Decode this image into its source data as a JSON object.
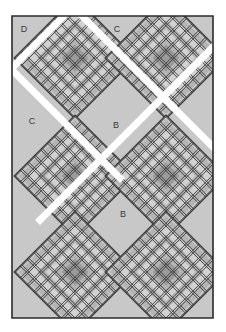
{
  "figure": {
    "kind": "quilt-block-layout-diagram",
    "width": 226,
    "height": 332,
    "background": "#ffffff"
  },
  "palette": {
    "page_background": "#ffffff",
    "quilt_background": "#c8c8c8",
    "block_field": "#c4c4c4",
    "lattice_light": "#d2d2d2",
    "lattice_mid": "#b4b4b4",
    "lattice_dark_line": "#3c3c3c",
    "block_center": "#9a9a9a",
    "sashing": "#ffffff",
    "border_line": "#2b2b2b",
    "label_text": "#3a3a3a"
  },
  "labels": [
    {
      "id": "label-d",
      "text": "D",
      "x": 24,
      "y": 30
    },
    {
      "id": "label-c1",
      "text": "C",
      "x": 117,
      "y": 30
    },
    {
      "id": "label-c2",
      "text": "C",
      "x": 32,
      "y": 122
    },
    {
      "id": "label-b1",
      "text": "B",
      "x": 116,
      "y": 126
    },
    {
      "id": "label-b2",
      "text": "B",
      "x": 123,
      "y": 215
    }
  ],
  "plain_blocks": [
    {
      "id": "plain-d",
      "label": "D"
    },
    {
      "id": "plain-c1",
      "label": "C"
    },
    {
      "id": "plain-c2",
      "label": "C"
    },
    {
      "id": "plain-b1",
      "label": "B"
    },
    {
      "id": "plain-b2",
      "label": "B"
    }
  ],
  "patterned_blocks": [
    {
      "id": "patch-r1c1",
      "cx": 75,
      "cy": 58,
      "size": 86
    },
    {
      "id": "patch-r1c2",
      "cx": 166,
      "cy": 58,
      "size": 86
    },
    {
      "id": "patch-r2c1",
      "cx": 75,
      "cy": 176,
      "size": 86
    },
    {
      "id": "patch-r2c2",
      "cx": 166,
      "cy": 176,
      "size": 86
    },
    {
      "id": "patch-r3c1",
      "cx": 75,
      "cy": 272,
      "size": 86
    },
    {
      "id": "patch-r3c2",
      "cx": 166,
      "cy": 272,
      "size": 86
    }
  ],
  "block_pattern": {
    "name": "plaid-lattice-on-point",
    "center_square_ratio": 0.22,
    "ring_ratios": [
      0.34,
      0.48,
      0.62,
      0.78,
      0.92
    ],
    "line_count": 9
  },
  "sashing": {
    "color": "#ffffff",
    "width": 7,
    "orientation": "diagonal"
  }
}
